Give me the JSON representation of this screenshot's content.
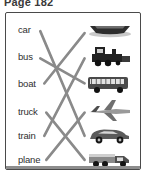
{
  "page": {
    "title": "Page 182"
  },
  "worksheet": {
    "type": "matching-exercise",
    "line_color": "#8a8a8a",
    "border_color": "#4a4a4a",
    "text_color": "#2f2f2f",
    "words": [
      {
        "id": "car",
        "label": "car",
        "x": 12,
        "y": 16
      },
      {
        "id": "bus",
        "label": "bus",
        "x": 12,
        "y": 43
      },
      {
        "id": "boat",
        "label": "boat",
        "x": 12,
        "y": 70
      },
      {
        "id": "truck",
        "label": "truck",
        "x": 12,
        "y": 98
      },
      {
        "id": "train",
        "label": "train",
        "x": 12,
        "y": 122
      },
      {
        "id": "plane",
        "label": "plane",
        "x": 12,
        "y": 146
      }
    ],
    "pictures": [
      {
        "id": "boat",
        "name": "boat-image",
        "alt": "boat",
        "x": 80,
        "y": 16
      },
      {
        "id": "train",
        "name": "train-image",
        "alt": "train",
        "x": 80,
        "y": 43
      },
      {
        "id": "bus",
        "name": "bus-image",
        "alt": "bus",
        "x": 80,
        "y": 70
      },
      {
        "id": "plane",
        "name": "plane-image",
        "alt": "plane",
        "x": 80,
        "y": 98
      },
      {
        "id": "car",
        "name": "car-image",
        "alt": "car",
        "x": 80,
        "y": 122
      },
      {
        "id": "truck",
        "name": "truck-image",
        "alt": "truck",
        "x": 80,
        "y": 146
      }
    ],
    "connections": [
      {
        "from": "car",
        "to": "car",
        "x1": 34,
        "y1": 18,
        "x2": 78,
        "y2": 122
      },
      {
        "from": "bus",
        "to": "bus",
        "x1": 34,
        "y1": 45,
        "x2": 78,
        "y2": 70
      },
      {
        "from": "boat",
        "to": "boat",
        "x1": 38,
        "y1": 70,
        "x2": 78,
        "y2": 20
      },
      {
        "from": "truck",
        "to": "truck",
        "x1": 40,
        "y1": 99,
        "x2": 78,
        "y2": 146
      },
      {
        "from": "train",
        "to": "train",
        "x1": 38,
        "y1": 122,
        "x2": 78,
        "y2": 45
      },
      {
        "from": "plane",
        "to": "plane",
        "x1": 40,
        "y1": 146,
        "x2": 78,
        "y2": 99
      }
    ]
  }
}
